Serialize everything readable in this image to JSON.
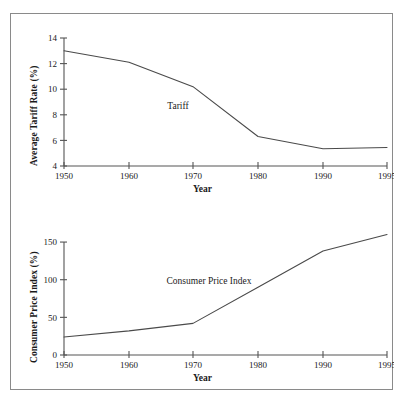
{
  "figure": {
    "background": "#ffffff",
    "border_color": "#8a8a8a",
    "line_color": "#4a4a4a",
    "axis_color": "#555555"
  },
  "chart_data": [
    {
      "type": "line",
      "id": "tariff",
      "title": "",
      "xlabel": "Year",
      "ylabel": "Average Tariff Rate (%)",
      "x": [
        1950,
        1960,
        1970,
        1980,
        1990,
        1995
      ],
      "xticklabels": [
        "1950",
        "1960",
        "1970",
        "1980",
        "1990",
        "1995"
      ],
      "yticks": [
        4,
        6,
        8,
        10,
        12,
        14
      ],
      "yticklabels": [
        "4",
        "6",
        "8",
        "10",
        "12",
        "14"
      ],
      "ylim": [
        4,
        14
      ],
      "grid": false,
      "legend": "none",
      "series": [
        {
          "name": "Tariff",
          "annotation": "Tariff",
          "values": [
            13.0,
            12.1,
            10.2,
            6.3,
            5.35,
            5.45
          ]
        }
      ]
    },
    {
      "type": "line",
      "id": "cpi",
      "title": "",
      "xlabel": "Year",
      "ylabel": "Consumer Price Index (%)",
      "x": [
        1950,
        1960,
        1970,
        1980,
        1990,
        1995
      ],
      "xticklabels": [
        "1950",
        "1960",
        "1970",
        "1980",
        "1990",
        "1995"
      ],
      "yticks": [
        0,
        50,
        100,
        150
      ],
      "yticklabels": [
        "0",
        "50",
        "100",
        "150"
      ],
      "ylim": [
        0,
        170
      ],
      "grid": false,
      "legend": "none",
      "series": [
        {
          "name": "Consumer Price Index",
          "annotation": "Consumer Price Index",
          "values": [
            24,
            32,
            42,
            90,
            138,
            160
          ]
        }
      ]
    }
  ]
}
